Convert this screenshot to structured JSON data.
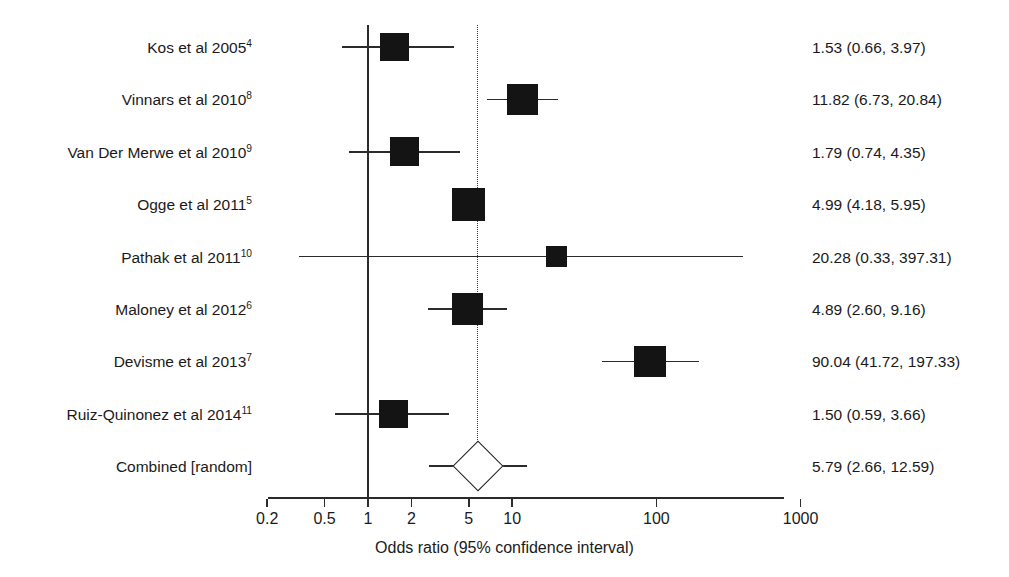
{
  "chart_data": {
    "type": "forest",
    "title": "",
    "xlabel": "Odds ratio (95% confidence interval)",
    "ylabel": "",
    "x_scale": "log",
    "xlim": [
      0.2,
      1000
    ],
    "ticks": [
      {
        "value": 0.2,
        "label": "0.2"
      },
      {
        "value": 0.5,
        "label": "0.5"
      },
      {
        "value": 1,
        "label": "1"
      },
      {
        "value": 2,
        "label": "2"
      },
      {
        "value": 5,
        "label": "5"
      },
      {
        "value": 10,
        "label": "10"
      },
      {
        "value": 100,
        "label": "100"
      },
      {
        "value": 1000,
        "label": "1000"
      }
    ],
    "grid": false,
    "legend": null,
    "null_line_value": 1,
    "pooled_line_value": 5.79,
    "effect_measure": "Odds ratio",
    "studies": [
      {
        "label": "Kos et al 2005",
        "ref": "4",
        "estimate": 1.53,
        "ci_low": 0.66,
        "ci_high": 3.97,
        "stat": "1.53 (0.66, 3.97)",
        "weight": 0.52,
        "pooled": false
      },
      {
        "label": "Vinnars et al 2010",
        "ref": "8",
        "estimate": 11.82,
        "ci_low": 6.73,
        "ci_high": 20.84,
        "stat": "11.82 (6.73, 20.84)",
        "weight": 0.6,
        "pooled": false
      },
      {
        "label": "Van Der Merwe et al 2010",
        "ref": "9",
        "estimate": 1.79,
        "ci_low": 0.74,
        "ci_high": 4.35,
        "stat": "1.79 (0.74, 4.35)",
        "weight": 0.54,
        "pooled": false
      },
      {
        "label": "Ogge et al 2011",
        "ref": "5",
        "estimate": 4.99,
        "ci_low": 4.18,
        "ci_high": 5.95,
        "stat": "4.99 (4.18, 5.95)",
        "weight": 0.7,
        "pooled": false
      },
      {
        "label": "Pathak et al 2011",
        "ref": "10",
        "estimate": 20.28,
        "ci_low": 0.33,
        "ci_high": 397.31,
        "stat": "20.28 (0.33, 397.31)",
        "weight": 0.26,
        "pooled": false
      },
      {
        "label": "Maloney et al 2012",
        "ref": "6",
        "estimate": 4.89,
        "ci_low": 2.6,
        "ci_high": 9.16,
        "stat": "4.89 (2.60, 9.16)",
        "weight": 0.62,
        "pooled": false
      },
      {
        "label": "Devisme et al 2013",
        "ref": "7",
        "estimate": 90.04,
        "ci_low": 41.72,
        "ci_high": 197.33,
        "stat": "90.04 (41.72, 197.33)",
        "weight": 0.63,
        "pooled": false
      },
      {
        "label": "Ruiz-Quinonez et al 2014",
        "ref": "11",
        "estimate": 1.5,
        "ci_low": 0.59,
        "ci_high": 3.66,
        "stat": "1.50 (0.59, 3.66)",
        "weight": 0.52,
        "pooled": false
      },
      {
        "label": "Combined [random]",
        "ref": "",
        "estimate": 5.79,
        "ci_low": 2.66,
        "ci_high": 12.59,
        "stat": "5.79 (2.66, 12.59)",
        "weight": 1.0,
        "pooled": true
      }
    ]
  },
  "colors": {
    "marker": "#141414",
    "line": "#2b2b2b",
    "text": "#1a1a1a",
    "background": "#ffffff"
  }
}
